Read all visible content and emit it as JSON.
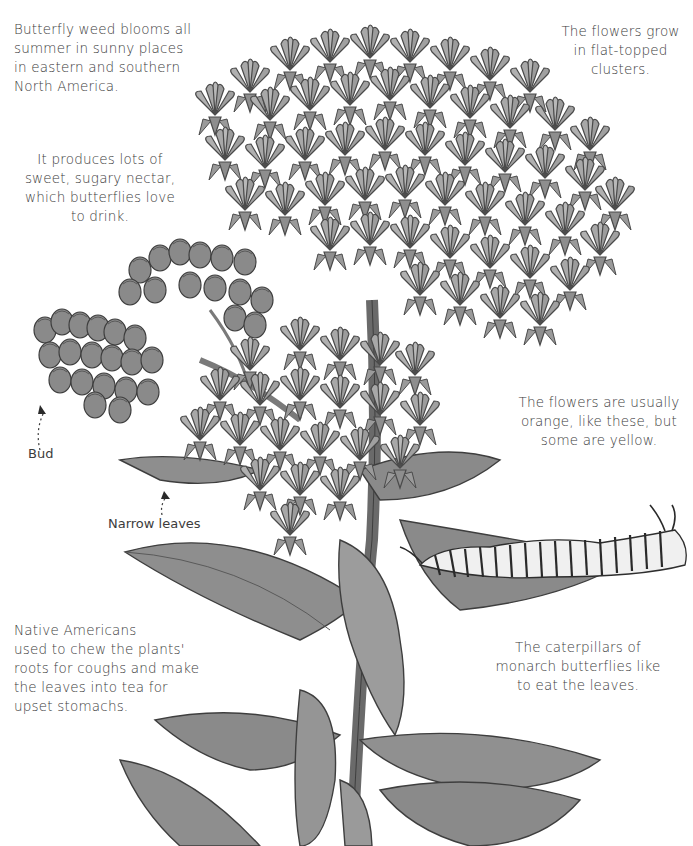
{
  "illustration": {
    "subject": "butterfly-weed-plant",
    "palette": {
      "background": "#ffffff",
      "flower_fill": "#9a9a9a",
      "flower_light": "#b8b8b8",
      "outline": "#4a4a4a",
      "leaf_fill": "#8c8c8c",
      "leaf_light": "#a8a8a8",
      "stem": "#6e6e6e",
      "caterpillar_body": "#f2f2f2",
      "caterpillar_stripe": "#2a2a2a",
      "text": "#3c3c3c"
    }
  },
  "notes": [
    {
      "id": "intro",
      "lines": [
        "Butterfly weed blooms all",
        "summer in sunny places",
        "in eastern and southern",
        "North America."
      ]
    },
    {
      "id": "clusters",
      "lines": [
        "The flowers grow",
        "in flat-topped",
        "clusters."
      ]
    },
    {
      "id": "nectar",
      "lines": [
        "It produces lots of",
        "sweet, sugary nectar,",
        "which butterflies love",
        "to drink."
      ]
    },
    {
      "id": "colors",
      "lines": [
        "The flowers are usually",
        "orange, like these, but",
        "some are yellow."
      ]
    },
    {
      "id": "native-uses",
      "lines": [
        "Native Americans",
        "used to chew the plants'",
        "roots for coughs and make",
        "the leaves into tea for",
        "upset stomachs."
      ]
    },
    {
      "id": "caterpillars",
      "lines": [
        "The caterpillars of",
        "monarch butterflies like",
        "to eat the leaves."
      ]
    }
  ],
  "labels": {
    "bud": "Bud",
    "narrow_leaves": "Narrow leaves"
  }
}
